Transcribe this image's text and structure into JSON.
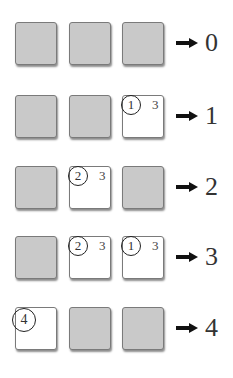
{
  "diagram": {
    "rows": [
      {
        "cells": [
          {
            "state": "gray"
          },
          {
            "state": "gray"
          },
          {
            "state": "gray"
          }
        ],
        "result": "0"
      },
      {
        "cells": [
          {
            "state": "gray"
          },
          {
            "state": "gray"
          },
          {
            "state": "white",
            "circle": "1",
            "side": "3"
          }
        ],
        "result": "1"
      },
      {
        "cells": [
          {
            "state": "gray"
          },
          {
            "state": "white",
            "circle": "2",
            "side": "3"
          },
          {
            "state": "gray"
          }
        ],
        "result": "2"
      },
      {
        "cells": [
          {
            "state": "gray"
          },
          {
            "state": "white",
            "circle": "2",
            "side": "3"
          },
          {
            "state": "white",
            "circle": "1",
            "side": "3"
          }
        ],
        "result": "3"
      },
      {
        "cells": [
          {
            "state": "white",
            "circle": "4"
          },
          {
            "state": "gray"
          },
          {
            "state": "gray"
          }
        ],
        "result": "4"
      }
    ],
    "arrow_icon": "right-arrow-icon",
    "colors": {
      "gray_fill": "#c9c9c9",
      "white_fill": "#ffffff",
      "border": "#7a7a7a",
      "ink": "#222222"
    }
  }
}
